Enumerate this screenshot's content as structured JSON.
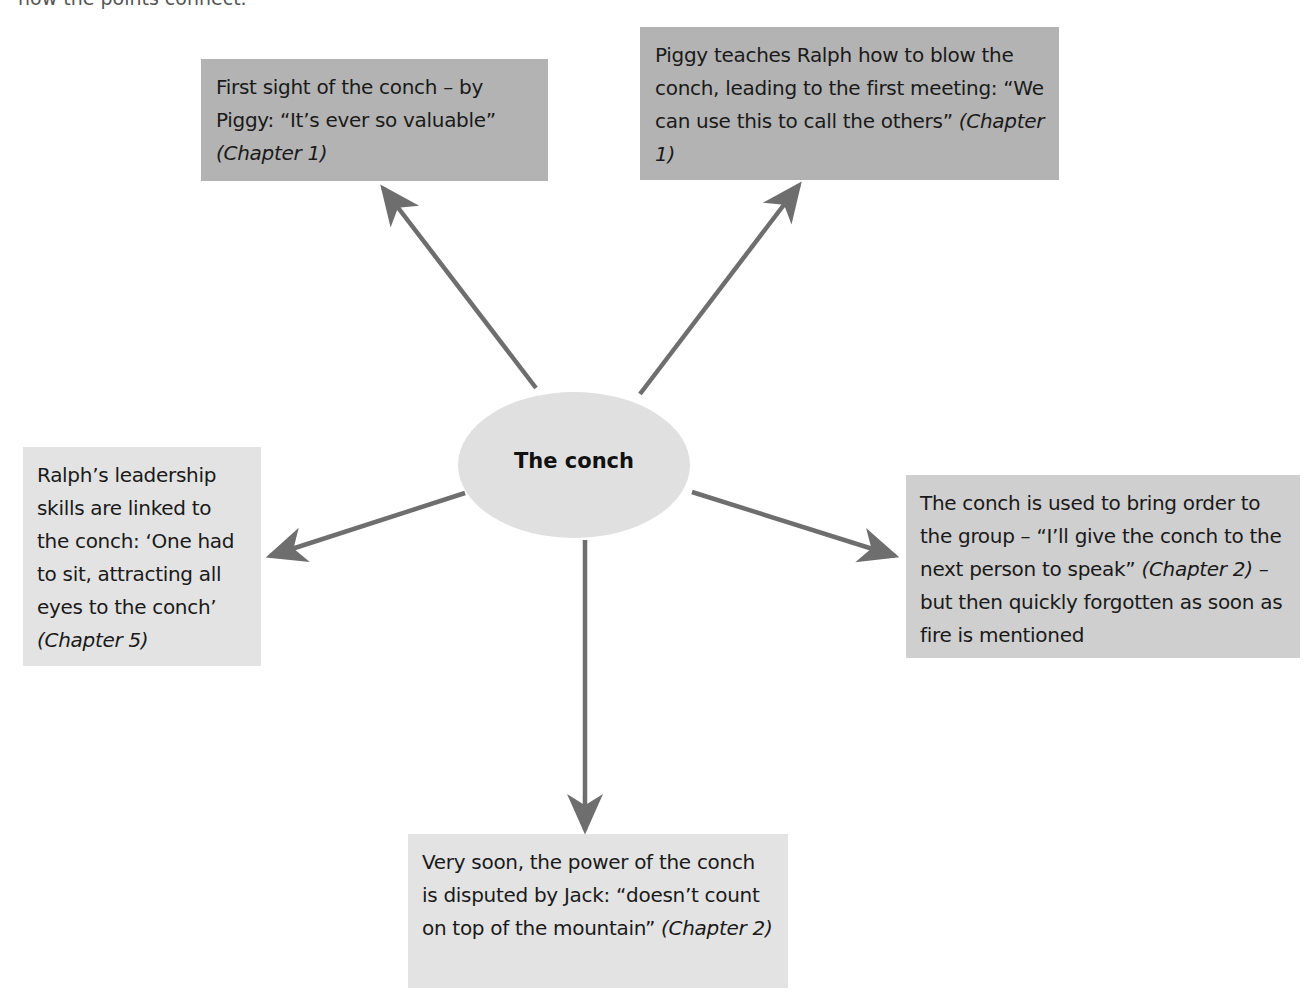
{
  "caption_clipped": "how the points connect.",
  "colors": {
    "dark_box": "#b3b3b3",
    "mid_box": "#cfcfcf",
    "light_box": "#e3e3e3",
    "center_node": "#e0e0e0",
    "arrow": "#6e6e6e"
  },
  "center": {
    "label": "The conch"
  },
  "nodes": [
    {
      "id": "top-left",
      "text": "First sight of the conch – by Piggy: “It’s ever so valuable”",
      "cite": "(Chapter 1)",
      "shade": "dark"
    },
    {
      "id": "top-right",
      "text": "Piggy teaches Ralph how to blow the conch, leading to the first meeting: “We can use this to call the others”",
      "cite": "(Chapter 1)",
      "shade": "dark"
    },
    {
      "id": "left",
      "text": "Ralph’s leadership skills are linked to the conch: ‘One had to sit, attracting all eyes to the conch’",
      "cite": "(Chapter 5)",
      "shade": "light"
    },
    {
      "id": "right",
      "text_before": "The conch is used to bring order to the group – “I’ll give the conch to the next person to speak”",
      "cite": "(Chapter 2)",
      "text_after": "– but then quickly forgotten as soon as fire is mentioned",
      "shade": "mid"
    },
    {
      "id": "bottom",
      "text": "Very soon, the power of the conch is disputed by Jack: “doesn’t count on top of the mountain”",
      "cite": "(Chapter 2)",
      "shade": "light"
    }
  ]
}
